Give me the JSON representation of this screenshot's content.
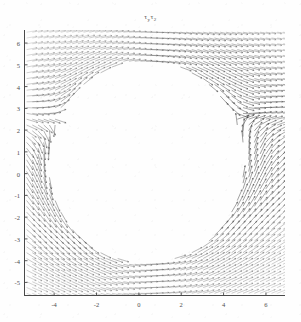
{
  "figure": {
    "title_main": "τ",
    "title_sub1": "y",
    "title_main2": "τ",
    "title_sub2": "2",
    "title_full": "τy τ2",
    "background_color": "#fefefe",
    "ink_color": "#3a3a3a",
    "axis_color": "#4a4a4a"
  },
  "chart_data": {
    "type": "scatter",
    "render": "quiver",
    "xlabel": "",
    "ylabel": "",
    "grid": false,
    "legend": false,
    "frame": "left-and-bottom-spines-only",
    "xlim": [
      -5.4,
      6.9
    ],
    "ylim": [
      -5.6,
      6.6
    ],
    "xticks": [
      -4,
      -2,
      0,
      2,
      4,
      6
    ],
    "xtick_labels": [
      "-4",
      "-2",
      "0",
      "2",
      "4",
      "6"
    ],
    "yticks": [
      6,
      5,
      4,
      3,
      2,
      1,
      0,
      -1,
      -2,
      -3,
      -4,
      -5
    ],
    "ytick_labels": [
      "6",
      "5",
      "4",
      "3",
      "2",
      "1",
      "0",
      "-1",
      "-2",
      "-3",
      "-4",
      "-5"
    ],
    "obstacle": {
      "shape": "circle",
      "center_x": 0.35,
      "center_y": 0.55,
      "radius": 4.55,
      "fill": "white",
      "note": "no vectors are plotted inside this region"
    },
    "vector_grid": {
      "nx": 46,
      "ny": 46,
      "x_start": -5.3,
      "x_end": 6.8,
      "y_start": -5.5,
      "y_end": 6.5,
      "field_model": "tangential-circulation around obstacle",
      "arrow_length_units": 0.42
    },
    "intensity_regions": [
      {
        "name": "right-crescent",
        "x": 5.2,
        "y": 0.6,
        "darkness": 0.92
      },
      {
        "name": "upper-right-streaks",
        "x": 4.6,
        "y": 4.8,
        "darkness": 0.72
      },
      {
        "name": "left-arc",
        "x": -3.9,
        "y": 0.2,
        "darkness": 0.55
      },
      {
        "name": "lower-left",
        "x": -4.2,
        "y": -3.8,
        "darkness": 0.48
      },
      {
        "name": "upper-left",
        "x": -4.3,
        "y": 4.6,
        "darkness": 0.3
      },
      {
        "name": "lower-right",
        "x": 5.4,
        "y": -4.4,
        "darkness": 0.5
      }
    ]
  }
}
